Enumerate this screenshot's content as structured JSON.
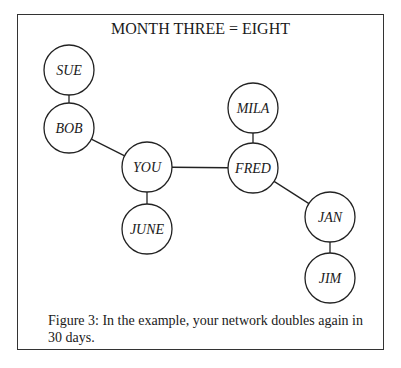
{
  "figure": {
    "title": "MONTH THREE = EIGHT",
    "caption": "Figure 3: In the example, your network doubles again in 30 days.",
    "nodes": [
      {
        "id": "sue",
        "label": "SUE",
        "cx": 69,
        "cy": 70
      },
      {
        "id": "bob",
        "label": "BOB",
        "cx": 69,
        "cy": 128
      },
      {
        "id": "you",
        "label": "YOU",
        "cx": 147,
        "cy": 167
      },
      {
        "id": "june",
        "label": "JUNE",
        "cx": 147,
        "cy": 229
      },
      {
        "id": "mila",
        "label": "MILA",
        "cx": 253,
        "cy": 108
      },
      {
        "id": "fred",
        "label": "FRED",
        "cx": 253,
        "cy": 168
      },
      {
        "id": "jan",
        "label": "JAN",
        "cx": 330,
        "cy": 217
      },
      {
        "id": "jim",
        "label": "JIM",
        "cx": 330,
        "cy": 278
      }
    ],
    "edges": [
      [
        "sue",
        "bob"
      ],
      [
        "bob",
        "you"
      ],
      [
        "you",
        "june"
      ],
      [
        "you",
        "fred"
      ],
      [
        "mila",
        "fred"
      ],
      [
        "fred",
        "jan"
      ],
      [
        "jan",
        "jim"
      ]
    ],
    "node_radius": 25,
    "stroke_color": "#222222"
  }
}
